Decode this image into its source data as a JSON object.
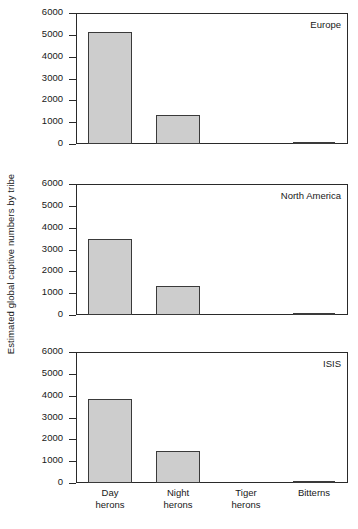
{
  "figure": {
    "ylabel": "Estimated global captive numbers by tribe",
    "bar_color": "#cdcdcd",
    "axis_color": "#2a2a2a"
  },
  "chart_data": {
    "type": "bar",
    "title": "",
    "xlabel": "",
    "ylabel": "Estimated global captive numbers by tribe",
    "ylim": [
      0,
      6000
    ],
    "yticks": [
      0,
      1000,
      2000,
      3000,
      4000,
      5000,
      6000
    ],
    "ytick_labels": [
      "0",
      "1000",
      "2000",
      "3000",
      "4000",
      "5000",
      "6000"
    ],
    "grid": false,
    "legend": "none",
    "categories": [
      "Day herons",
      "Night herons",
      "Tiger herons",
      "Bitterns"
    ],
    "category_lines": [
      [
        "Day",
        "herons"
      ],
      [
        "Night",
        "herons"
      ],
      [
        "Tiger",
        "herons"
      ],
      [
        "Bitterns",
        ""
      ]
    ],
    "panels": [
      {
        "label": "Europe",
        "values": [
          5150,
          1350,
          0,
          60
        ]
      },
      {
        "label": "North America",
        "values": [
          3500,
          1350,
          0,
          40
        ]
      },
      {
        "label": "ISIS",
        "values": [
          3870,
          1450,
          0,
          70
        ]
      }
    ]
  }
}
